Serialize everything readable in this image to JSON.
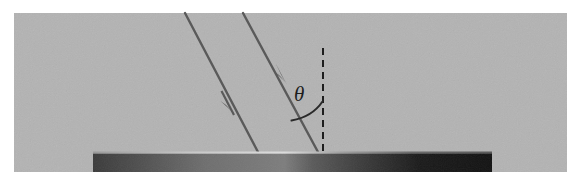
{
  "figure": {
    "caption": "",
    "background_color": "#ffffff",
    "panel": {
      "name": "medium-region",
      "fill_color": "#b3b3b3",
      "x": 14,
      "y": 13,
      "width": 553,
      "height": 159
    },
    "surface_bar": {
      "name": "reflective-surface",
      "x": 93,
      "y": 152,
      "width": 399,
      "height": 20,
      "gradient_stops": [
        {
          "offset": 0,
          "color": "#3a3a3a"
        },
        {
          "offset": 0.1,
          "color": "#4c4c4c"
        },
        {
          "offset": 0.28,
          "color": "#6e6e6e"
        },
        {
          "offset": 0.48,
          "color": "#7d7d7d"
        },
        {
          "offset": 0.55,
          "color": "#5a5a5a"
        },
        {
          "offset": 0.68,
          "color": "#3a3a3a"
        },
        {
          "offset": 0.82,
          "color": "#1a1a1a"
        },
        {
          "offset": 1,
          "color": "#121212"
        }
      ],
      "highlight_color": "#cfcfcf"
    },
    "rays": [
      {
        "name": "incident-ray-left",
        "label": "",
        "x1": 185,
        "y1": 13,
        "x2": 258,
        "y2": 152,
        "color": "#5a5a5a",
        "stroke_width": 2.4,
        "arrow_at": {
          "x": 228,
          "y": 104
        }
      },
      {
        "name": "incident-ray-right",
        "label": "",
        "x1": 243,
        "y1": 13,
        "x2": 318,
        "y2": 152,
        "color": "#5a5a5a",
        "stroke_width": 2.4,
        "arrow_at": {
          "x": 281,
          "y": 74
        }
      }
    ],
    "normal_line": {
      "name": "surface-normal",
      "x1": 323,
      "y1": 48,
      "x2": 323,
      "y2": 152,
      "color": "#1d1d1d",
      "stroke_width": 2,
      "dash_pattern": "7,5"
    },
    "angle_arc": {
      "name": "incidence-angle-arc",
      "color": "#2a2a2a",
      "stroke_width": 2,
      "start": {
        "x": 292,
        "y": 120
      },
      "end": {
        "x": 323,
        "y": 102
      },
      "radius": 56
    },
    "angle_label": {
      "name": "theta-label",
      "text": "θ",
      "x": 294,
      "y": 100,
      "color": "#1d1d1d"
    }
  }
}
